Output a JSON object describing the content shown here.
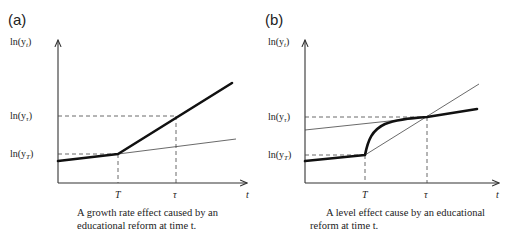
{
  "panels": [
    {
      "id": "a",
      "label": "(a)",
      "y_axis_label": "ln(y_t)",
      "x_axis_label": "t",
      "y_ticks": [
        "ln(y_τ)",
        "ln(y_T)"
      ],
      "x_ticks": [
        "T",
        "τ"
      ],
      "caption_line1": "A growth rate effect caused by an",
      "caption_line2": "educational reform at time t.",
      "description": "Growth rate effect: after reform at T, the slope of ln(y) increases permanently (thick line); thin line shows the counterfactual original trend."
    },
    {
      "id": "b",
      "label": "(b)",
      "y_axis_label": "ln(y_t)",
      "x_axis_label": "t",
      "y_ticks": [
        "ln(y_τ)",
        "ln(y_T)"
      ],
      "x_ticks": [
        "T",
        "τ"
      ],
      "caption_line1": "A level effect cause by an educational",
      "caption_line2": "reform at time t.",
      "description": "Level effect: after reform at T, ln(y) rises along a concave curve to a new higher parallel path reached at τ; thin lines show old trend shifted up and a transitional tangent."
    }
  ],
  "labels": {
    "y_axis_prefix": "ln(y",
    "y_axis_sub_t": "t",
    "y_axis_sub_tau": "τ",
    "y_axis_sub_T": "T",
    "close": ")"
  }
}
